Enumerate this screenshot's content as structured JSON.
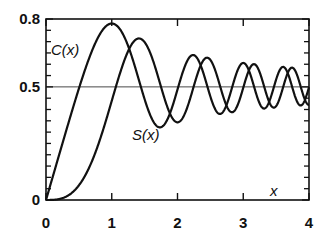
{
  "chart_data": {
    "type": "line",
    "title": "",
    "xlabel": "x",
    "ylabel": "",
    "xlim": [
      0,
      4
    ],
    "ylim": [
      0,
      0.8
    ],
    "x_ticks": [
      0,
      1,
      2,
      3,
      4
    ],
    "x_tick_labels": [
      "0",
      "1",
      "2",
      "3",
      "4"
    ],
    "y_tick_labels": [
      {
        "value": 0,
        "label": "0"
      },
      {
        "value": 0.5,
        "label": "0.5"
      },
      {
        "value": 0.8,
        "label": "0.8"
      }
    ],
    "y_minor_tick_step": 0.05,
    "x_minor_tick_step": 1,
    "reference_line": {
      "y": 0.5
    },
    "grid": false,
    "legend": null,
    "annotations": [
      {
        "text": "C(x)",
        "x": 0.1,
        "y": 0.66
      },
      {
        "text": "S(x)",
        "x": 1.3,
        "y": 0.28
      },
      {
        "text": "x",
        "x": 3.5,
        "y": 0.04
      }
    ],
    "x": [
      0,
      0.25,
      0.5,
      0.75,
      1.0,
      1.25,
      1.5,
      1.75,
      2.0,
      2.25,
      2.5,
      2.75,
      3.0,
      3.25,
      3.5,
      3.75,
      4.0
    ],
    "series": [
      {
        "name": "C(x)",
        "values": [
          0,
          0.25,
          0.492,
          0.694,
          0.78,
          0.704,
          0.445,
          0.322,
          0.488,
          0.636,
          0.457,
          0.401,
          0.606,
          0.529,
          0.533,
          0.413,
          0.498
        ]
      },
      {
        "name": "S(x)",
        "values": [
          0,
          0.008,
          0.065,
          0.209,
          0.438,
          0.654,
          0.697,
          0.499,
          0.343,
          0.53,
          0.619,
          0.406,
          0.496,
          0.595,
          0.415,
          0.506,
          0.421
        ]
      }
    ]
  }
}
